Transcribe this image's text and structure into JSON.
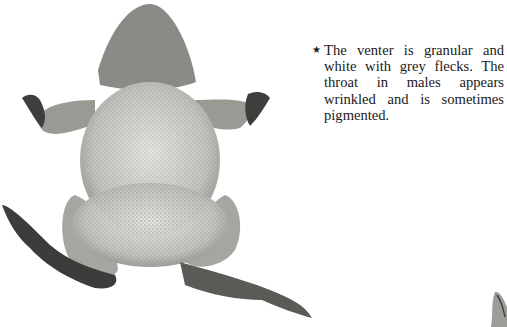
{
  "figure": {
    "tones": {
      "skin_light": "#d8d8d4",
      "skin_mid": "#a9a9a4",
      "skin_dark": "#4a4a48",
      "shadow": "#2e2e2e"
    }
  },
  "caption": {
    "bullet": "★",
    "text": "The venter is granular and white with grey flecks. The throat in males appears wrinkled and is sometimes pigmented."
  }
}
